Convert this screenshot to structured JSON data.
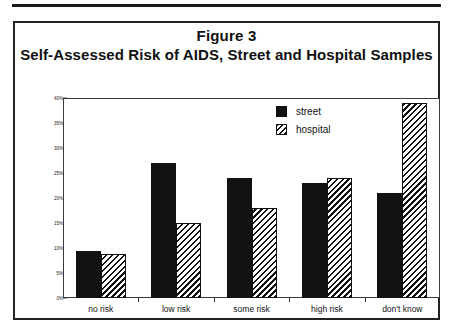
{
  "figure": {
    "caption_line1": "Figure 3",
    "caption_line2": "Self-Assessed Risk of AIDS, Street and Hospital Samples"
  },
  "legend": {
    "position": "top-right",
    "items": [
      {
        "label": "street",
        "swatch": "solid-black-square-icon"
      },
      {
        "label": "hospital",
        "swatch": "diagonal-hatch-square-icon"
      }
    ]
  },
  "chart_data": {
    "type": "bar",
    "title": "Self-Assessed Risk of AIDS, Street and Hospital Samples",
    "subtitle": "Figure 3",
    "xlabel": "",
    "ylabel": "",
    "categories": [
      "no risk",
      "low risk",
      "some risk",
      "high risk",
      "don't know"
    ],
    "series": [
      {
        "name": "street",
        "values": [
          9.5,
          27.0,
          24.0,
          23.0,
          21.0
        ]
      },
      {
        "name": "hospital",
        "values": [
          8.8,
          15.0,
          18.0,
          24.0,
          39.0
        ]
      }
    ],
    "ylim": [
      0,
      40
    ],
    "ytick_values": [
      0,
      5,
      10,
      15,
      20,
      25,
      30,
      35,
      40
    ],
    "ytick_labels": [
      "0%",
      "5%",
      "10%",
      "15%",
      "20%",
      "25%",
      "30%",
      "35%",
      "40%"
    ],
    "grid": false,
    "legend_position": "top-right",
    "colors": {
      "street": "#121212",
      "hospital": "#111111",
      "frame": "#3a3a3a",
      "text": "#111111"
    }
  }
}
